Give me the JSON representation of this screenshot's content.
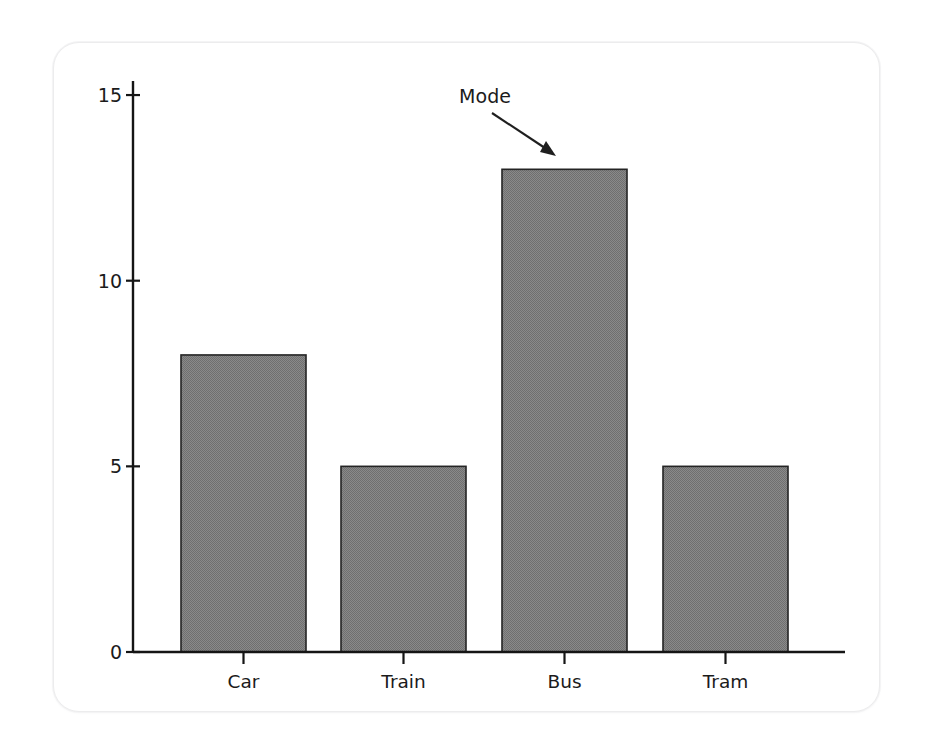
{
  "figure": {
    "card_background": "#ffffff",
    "card_border_color": "#ececed",
    "page_background": "#ffffff"
  },
  "chart_data": {
    "type": "bar",
    "title": "",
    "subtitle": "",
    "xlabel": "",
    "ylabel": "",
    "categories": [
      "Car",
      "Train",
      "Bus",
      "Tram"
    ],
    "values": [
      8,
      5,
      13,
      5
    ],
    "series": [
      {
        "name": "Count",
        "values": [
          8,
          5,
          13,
          5
        ]
      }
    ],
    "ylim": [
      0,
      15
    ],
    "y_ticks": [
      0,
      5,
      10,
      15
    ],
    "y_tick_labels": [
      "0",
      "5",
      "10",
      "15"
    ],
    "x_tick_labels": [
      "Car",
      "Train",
      "Bus",
      "Tram"
    ],
    "grid": false,
    "legend": null,
    "legend_position": "none",
    "bar_fill_color": "#808080",
    "bar_edge_color": "#242424",
    "axis_color": "#151515",
    "annotations": [
      {
        "text": "Mode",
        "target_category": "Bus",
        "target_value": 13,
        "label_x": 485,
        "label_y": 103,
        "arrow_start_x": 492,
        "arrow_start_y": 113,
        "arrow_end_x": 556,
        "arrow_end_y": 156
      }
    ]
  },
  "axes_geometry": {
    "x_axis_start_x": 133,
    "x_axis_end_x": 845,
    "baseline_y": 652,
    "y_axis_top_y": 81,
    "pixels_per_unit": 37.13,
    "bar_width": 125,
    "bar_left_positions": [
      181,
      341,
      502,
      663
    ],
    "tick_x_positions": [
      243.5,
      403.5,
      564.5,
      725.5
    ]
  }
}
